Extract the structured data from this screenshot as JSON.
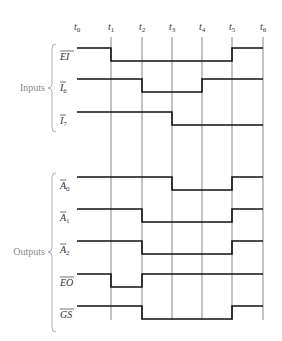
{
  "chart_data": {
    "type": "timing-diagram",
    "time_labels": [
      "t0",
      "t1",
      "t2",
      "t3",
      "t4",
      "t5",
      "t6"
    ],
    "groups": [
      {
        "name": "Inputs",
        "signals": [
          "EI",
          "I6",
          "I7"
        ]
      },
      {
        "name": "Outputs",
        "signals": [
          "A0",
          "A1",
          "A2",
          "EO",
          "GS"
        ]
      }
    ],
    "signals": [
      {
        "name": "EI",
        "label": "EI",
        "overbar": true,
        "sub": "",
        "levels": [
          1,
          0,
          0,
          0,
          0,
          1
        ]
      },
      {
        "name": "I6",
        "label": "I",
        "overbar": true,
        "sub": "6",
        "levels": [
          1,
          1,
          0,
          0,
          1,
          1
        ]
      },
      {
        "name": "I7",
        "label": "I",
        "overbar": true,
        "sub": "7",
        "levels": [
          1,
          1,
          1,
          0,
          0,
          0
        ]
      },
      {
        "name": "A0",
        "label": "A",
        "overbar": true,
        "sub": "0",
        "levels": [
          1,
          1,
          1,
          0,
          0,
          1
        ]
      },
      {
        "name": "A1",
        "label": "A",
        "overbar": true,
        "sub": "1",
        "levels": [
          1,
          1,
          0,
          0,
          0,
          1
        ]
      },
      {
        "name": "A2",
        "label": "A",
        "overbar": true,
        "sub": "2",
        "levels": [
          1,
          1,
          0,
          0,
          0,
          1
        ]
      },
      {
        "name": "EO",
        "label": "EO",
        "overbar": true,
        "sub": "",
        "levels": [
          1,
          0,
          1,
          1,
          1,
          1
        ]
      },
      {
        "name": "GS",
        "label": "GS",
        "overbar": true,
        "sub": "",
        "levels": [
          1,
          1,
          0,
          0,
          0,
          1
        ]
      }
    ]
  },
  "labels": {
    "inputs": "Inputs",
    "outputs": "Outputs",
    "t": [
      "t",
      "t",
      "t",
      "t",
      "t",
      "t",
      "t"
    ],
    "t_sub": [
      "0",
      "1",
      "2",
      "3",
      "4",
      "5",
      "6"
    ]
  },
  "colors": {
    "waveform": "#111111",
    "gridline": "#555555",
    "brace": "#999999"
  }
}
